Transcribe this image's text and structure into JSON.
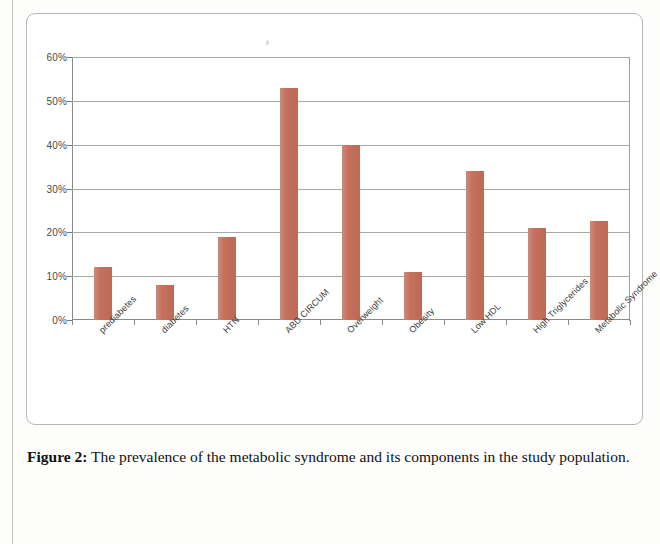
{
  "figure": {
    "label": "Figure 2:",
    "caption": " The prevalence of the metabolic syndrome and its components in the study population."
  },
  "colors": {
    "bar": "#c4705c",
    "gridline": "#a8a8a8",
    "axis": "#8a8a8a",
    "frame": "#b6b6b6",
    "text": "#3a3a3a"
  },
  "chart_data": {
    "type": "bar",
    "title": "",
    "xlabel": "",
    "ylabel": "",
    "ylim": [
      0,
      60
    ],
    "ytick_labels": [
      "0%",
      "10%",
      "20%",
      "30%",
      "40%",
      "50%",
      "60%"
    ],
    "ytick_values": [
      0,
      10,
      20,
      30,
      40,
      50,
      60
    ],
    "grid": true,
    "legend": false,
    "value_suffix": "%",
    "categories": [
      "prediabetes",
      "diabetes",
      "HTN",
      "ABD CIRCUM",
      "Overweight",
      "Obesity",
      "Low HDL",
      "High Triglycerides",
      "Metabolic Syndrome"
    ],
    "values": [
      12,
      8,
      19,
      53,
      40,
      11,
      34,
      21,
      22.5
    ],
    "series": [
      {
        "name": "prevalence",
        "values": [
          12,
          8,
          19,
          53,
          40,
          11,
          34,
          21,
          22.5
        ]
      }
    ]
  }
}
